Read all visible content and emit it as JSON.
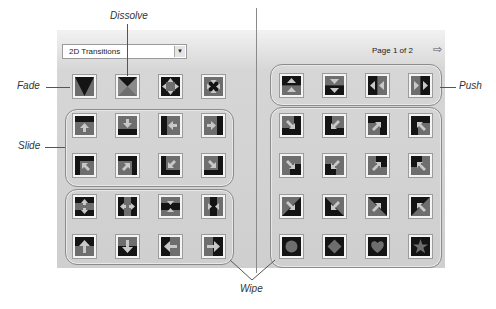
{
  "panel": {
    "dropdown": {
      "selected": "2D Transitions",
      "arrow": "▼"
    },
    "page_info": "Page 1 of 2",
    "next_page_icon": "⇨"
  },
  "callouts": {
    "dissolve": "Dissolve",
    "fade": "Fade",
    "push": "Push",
    "slide": "Slide",
    "wipe": "Wipe"
  },
  "colors": {
    "dark": "#141414",
    "mid": "#6e6e6e",
    "arrow": "#c8c8c8",
    "panel": "#d2d2d2"
  },
  "tiles": {
    "left": [
      [
        "fade",
        "dissolve",
        "push-out-4way",
        "push-in-4way"
      ],
      [
        "slide-up",
        "slide-down",
        "slide-left",
        "slide-right"
      ],
      [
        "slide-up-right",
        "slide-up-left",
        "slide-down-right",
        "slide-down-left"
      ],
      [
        "wipe-split-vertical-out",
        "wipe-split-horizontal-out",
        "wipe-split-vertical-in",
        "wipe-split-horizontal-in"
      ],
      [
        "wipe-up",
        "wipe-down",
        "wipe-left",
        "wipe-right"
      ]
    ],
    "right": [
      [
        "push-up",
        "push-down",
        "push-left",
        "push-right"
      ],
      [
        "slide-diag-down-right",
        "slide-diag-down-left",
        "slide-diag-up-right",
        "slide-diag-up-left"
      ],
      [
        "slide-diag-down-right-2",
        "slide-diag-down-left-2",
        "slide-diag-up-right-2",
        "slide-diag-up-left-2"
      ],
      [
        "wipe-diag-down-right",
        "wipe-diag-down-left",
        "wipe-diag-up-right",
        "wipe-diag-up-left"
      ],
      [
        "wipe-circle",
        "wipe-diamond",
        "wipe-heart",
        "wipe-star"
      ]
    ]
  }
}
